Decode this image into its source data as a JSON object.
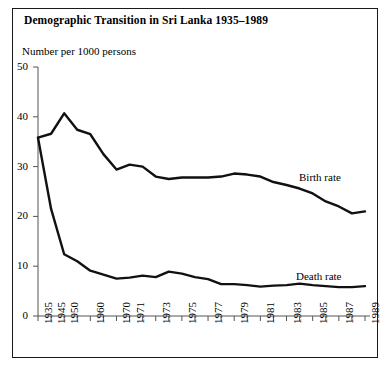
{
  "chart_data": {
    "type": "line",
    "title": "Demographic Transition in Sri Lanka 1935–1989",
    "ylabel": "Number per 1000 persons",
    "xlabel": "",
    "ylim": [
      0,
      50
    ],
    "yticks": [
      0,
      10,
      20,
      30,
      40,
      50
    ],
    "grid": false,
    "legend_position": "inline-annotations",
    "x": [
      1935,
      1945,
      1950,
      1955,
      1960,
      1965,
      1970,
      1971,
      1972,
      1973,
      1974,
      1975,
      1976,
      1977,
      1978,
      1979,
      1980,
      1981,
      1982,
      1983,
      1984,
      1985,
      1986,
      1987,
      1988,
      1989
    ],
    "xtick_labels": [
      "1935",
      "1945",
      "1950",
      "",
      "1960",
      "",
      "1970",
      "1971",
      "",
      "1973",
      "",
      "1975",
      "",
      "1977",
      "",
      "1979",
      "",
      "1981",
      "",
      "1983",
      "",
      "1985",
      "",
      "1987",
      "",
      "1989"
    ],
    "series": [
      {
        "name": "Birth rate",
        "values": [
          35.8,
          36.6,
          40.7,
          37.4,
          36.5,
          32.5,
          29.4,
          30.4,
          30.0,
          28.0,
          27.5,
          27.8,
          27.8,
          27.8,
          28.0,
          28.6,
          28.4,
          28.0,
          26.9,
          26.3,
          25.6,
          24.6,
          23.0,
          22.0,
          20.6,
          21.0
        ]
      },
      {
        "name": "Death rate",
        "values": [
          35.8,
          21.5,
          12.4,
          11.0,
          9.1,
          8.3,
          7.5,
          7.7,
          8.1,
          7.8,
          8.9,
          8.5,
          7.8,
          7.4,
          6.4,
          6.4,
          6.2,
          5.9,
          6.1,
          6.2,
          6.5,
          6.2,
          6.0,
          5.8,
          5.8,
          6.0
        ]
      }
    ]
  }
}
